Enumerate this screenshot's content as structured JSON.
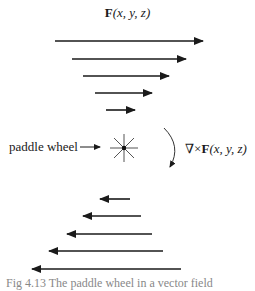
{
  "figure": {
    "title": {
      "bold": "F",
      "args": "(x, y, z)"
    },
    "paddle_wheel_label": "paddle wheel",
    "curl_label": {
      "prefix": "∇×",
      "bold": "F",
      "args": "(x, y, z)"
    },
    "caption": "Fig 4.13  The paddle wheel in a vector field"
  },
  "arrows_top": [
    {
      "y": 41,
      "x1": 55,
      "x2": 203
    },
    {
      "y": 59,
      "x1": 72,
      "x2": 186
    },
    {
      "y": 76,
      "x1": 83,
      "x2": 169
    },
    {
      "y": 93,
      "x1": 95,
      "x2": 152
    },
    {
      "y": 110,
      "x1": 106,
      "x2": 135
    }
  ],
  "arrows_bottom": [
    {
      "y": 199,
      "x1": 130,
      "x2": 100
    },
    {
      "y": 216,
      "x1": 141,
      "x2": 83
    },
    {
      "y": 234,
      "x1": 152,
      "x2": 67
    },
    {
      "y": 251,
      "x1": 163,
      "x2": 49
    },
    {
      "y": 269,
      "x1": 181,
      "x2": 32
    }
  ],
  "colors": {
    "ink": "#1a1a1a",
    "wheel": "#555555"
  }
}
